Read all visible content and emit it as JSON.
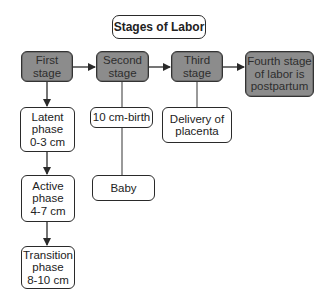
{
  "title": "Stages of Labor",
  "stages": [
    {
      "label": "First\nstage"
    },
    {
      "label": "Second\nstage"
    },
    {
      "label": "Third\nstage"
    },
    {
      "label": "Fourth stage\nof labor is\npostpartum"
    }
  ],
  "first_stage_phases": [
    {
      "label": "Latent\nphase\n0-3 cm"
    },
    {
      "label": "Active\nphase\n4-7 cm"
    },
    {
      "label": "Transition\nphase\n8-10 cm"
    }
  ],
  "second_stage_steps": [
    {
      "label": "10 cm-birth"
    },
    {
      "label": "Baby"
    }
  ],
  "third_stage_steps": [
    {
      "label": "Delivery of\nplacenta"
    }
  ],
  "colors": {
    "stage_fill": "#8c8c8c",
    "box_fill": "#ffffff",
    "line": "#2a2a2a"
  }
}
